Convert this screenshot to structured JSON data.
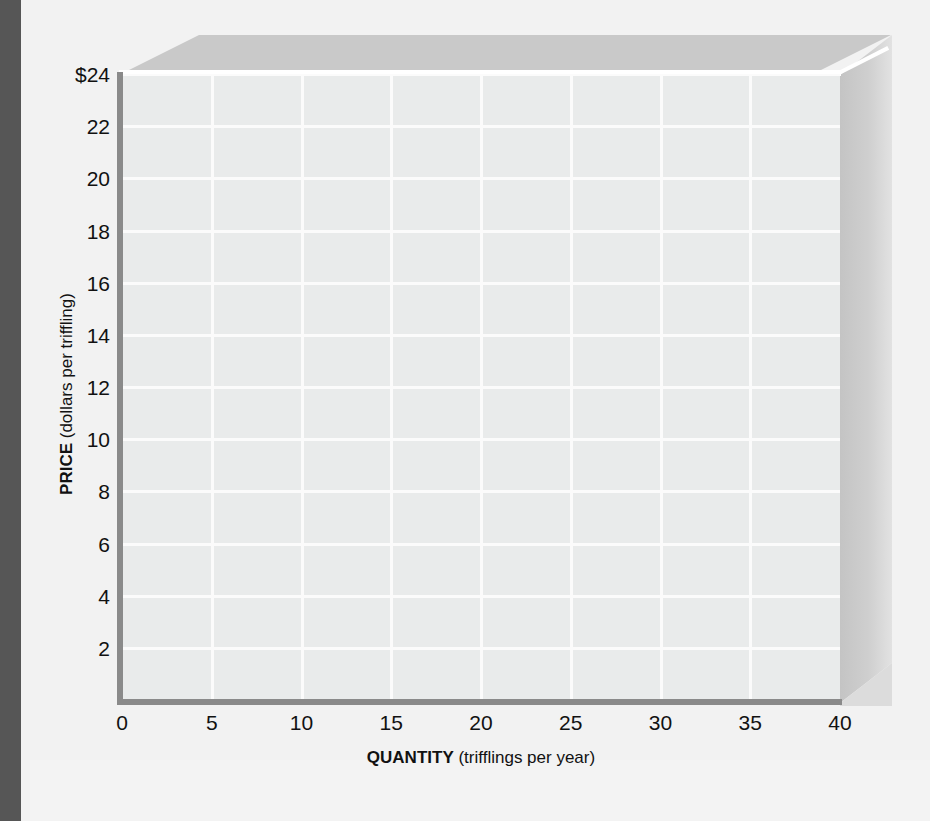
{
  "chart_data": {
    "type": "line",
    "title": "",
    "xlabel_bold": "QUANTITY",
    "xlabel_rest": " (trifflings per year)",
    "ylabel_bold": "PRICE",
    "ylabel_rest": " (dollars per triffling)",
    "xlim": [
      0,
      40
    ],
    "ylim": [
      0,
      24
    ],
    "x_tick_values": [
      0,
      5,
      10,
      15,
      20,
      25,
      30,
      35,
      40
    ],
    "x_tick_labels": [
      "0",
      "5",
      "10",
      "15",
      "20",
      "25",
      "30",
      "35",
      "40"
    ],
    "y_tick_values": [
      24,
      22,
      20,
      18,
      16,
      14,
      12,
      10,
      8,
      6,
      4,
      2
    ],
    "y_tick_labels": [
      "$24",
      "22",
      "20",
      "18",
      "16",
      "14",
      "12",
      "10",
      "8",
      "6",
      "4",
      "2"
    ],
    "grid": true,
    "grid_color": "#fbfbfb",
    "plot_background": "#e9ebeb",
    "axis_color": "#8a8a8a",
    "series": [],
    "legend": [],
    "annotations": [],
    "note": "Empty grid; no data series plotted."
  },
  "figure": {
    "page_background": "#f2f2f2",
    "gutter_color": "#565656",
    "slab_top_color": "#c9c9c9",
    "slab_right_color": "#cfcfcf",
    "highlight_color": "#ffffff"
  }
}
